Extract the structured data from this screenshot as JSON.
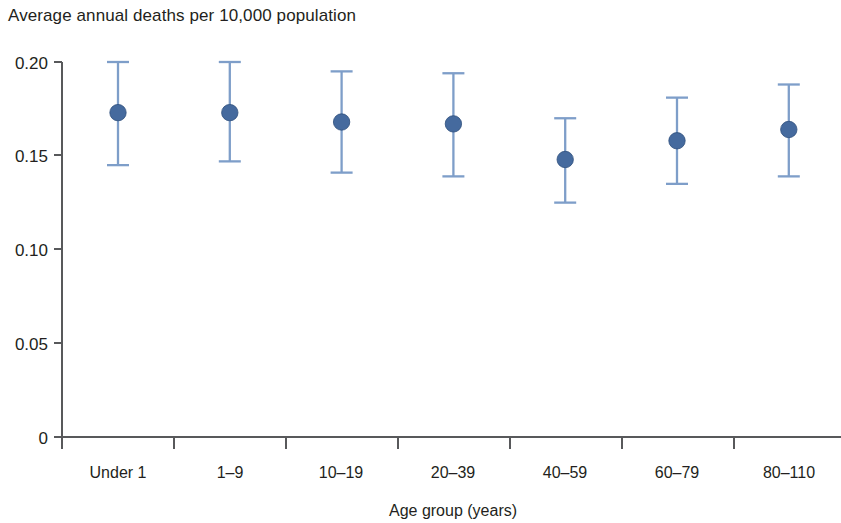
{
  "chart_data": {
    "type": "scatter",
    "title": "Average annual deaths per 10,000 population",
    "subtitle": "",
    "xlabel": "Age group (years)",
    "ylabel": "",
    "categories": [
      "Under 1",
      "1–9",
      "10–19",
      "20–39",
      "40–59",
      "60–79",
      "80–110"
    ],
    "values": [
      0.173,
      0.173,
      0.168,
      0.167,
      0.148,
      0.158,
      0.164
    ],
    "error_low": [
      0.145,
      0.147,
      0.141,
      0.139,
      0.125,
      0.135,
      0.139
    ],
    "error_high": [
      0.2,
      0.2,
      0.195,
      0.194,
      0.17,
      0.181,
      0.188
    ],
    "series": [
      {
        "name": "Average annual deaths per 10,000 population",
        "points": [
          {
            "category": "Under 1",
            "value": 0.173,
            "low": 0.145,
            "high": 0.2
          },
          {
            "category": "1–9",
            "value": 0.173,
            "low": 0.147,
            "high": 0.2
          },
          {
            "category": "10–19",
            "value": 0.168,
            "low": 0.141,
            "high": 0.195
          },
          {
            "category": "20–39",
            "value": 0.167,
            "low": 0.139,
            "high": 0.194
          },
          {
            "category": "40–59",
            "value": 0.148,
            "low": 0.125,
            "high": 0.17
          },
          {
            "category": "60–79",
            "value": 0.158,
            "low": 0.135,
            "high": 0.181
          },
          {
            "category": "80–110",
            "value": 0.164,
            "low": 0.139,
            "high": 0.188
          }
        ]
      }
    ],
    "ylim": [
      0,
      0.2
    ],
    "yticks": [
      0,
      0.05,
      0.1,
      0.15,
      0.2
    ],
    "ytick_labels": [
      "0",
      "0.05",
      "0.10",
      "0.15",
      "0.20"
    ],
    "grid": false,
    "legend": false,
    "legend_position": "none",
    "marker_color": "#456A9E",
    "marker_edge_color": "#2F4F7C",
    "errorbar_color": "#7E9EC9",
    "axis_color": "#58595b",
    "text_color": "#231f20"
  },
  "axes": {
    "y_tick_labels": [
      "0.20",
      "0.15",
      "0.10",
      "0.05",
      "0"
    ],
    "x_tick_labels": [
      "Under 1",
      "1–9",
      "10–19",
      "20–39",
      "40–59",
      "60–79",
      "80–110"
    ],
    "x_axis_title": "Age group (years)"
  },
  "header": {
    "title": "Average annual deaths per 10,000 population"
  }
}
